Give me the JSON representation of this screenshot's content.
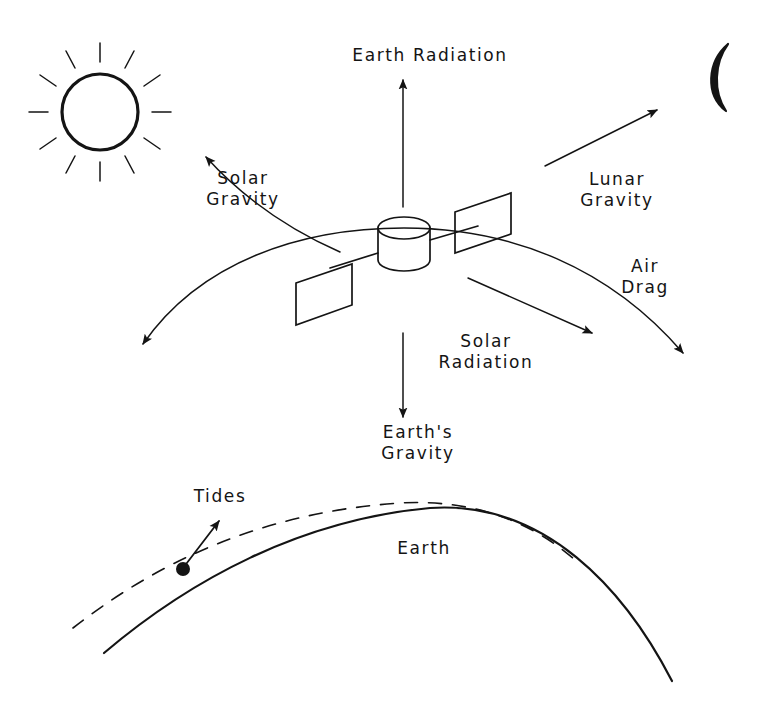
{
  "diagram": {
    "ink_color": "#141414",
    "background_color": "#ffffff",
    "labels": {
      "earth_radiation": "Earth Radiation",
      "solar_gravity": "Solar\nGravity",
      "lunar_gravity": "Lunar\nGravity",
      "air_drag": "Air\nDrag",
      "solar_radiation": "Solar\nRadiation",
      "earths_gravity": "Earth's\nGravity",
      "tides": "Tides",
      "earth": "Earth"
    },
    "objects": {
      "sun": "sun-icon",
      "moon": "crescent-moon-icon",
      "satellite": "satellite-icon",
      "orbit": "orbit-arc",
      "earth_surface": "earth-surface-curve",
      "tidal_bulge": "tidal-bulge-dashed-curve",
      "tide_point": "tide-point-marker"
    },
    "forces": [
      {
        "name": "Earth Radiation",
        "direction": "up"
      },
      {
        "name": "Solar Gravity",
        "direction": "up-left"
      },
      {
        "name": "Lunar Gravity",
        "direction": "up-right"
      },
      {
        "name": "Air Drag",
        "direction": "along-orbit"
      },
      {
        "name": "Solar Radiation",
        "direction": "down-right"
      },
      {
        "name": "Earth's Gravity",
        "direction": "down"
      },
      {
        "name": "Tides",
        "direction": "up-right"
      }
    ]
  }
}
